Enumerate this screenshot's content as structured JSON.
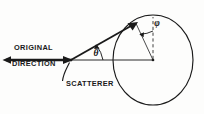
{
  "figure": {
    "background_color": "#fdfdfc",
    "ink_color": "#1a1a1a",
    "width": 204,
    "height": 114,
    "labels": {
      "original_line1": "ORIGINAL",
      "original_line2": "DIRECTION",
      "scatterer": "SCATTERER",
      "theta": "θ",
      "phi": "φ"
    },
    "elements": {
      "incident_beam": "horizontal double-ended arrow along original direction",
      "scattered_ray": "arrow from scatterer to point on sphere",
      "sphere": "ellipse representing sphere of observation",
      "radius_line": "line from sphere center to scattered ray endpoint",
      "polar_axis": "dashed vertical line from sphere center upward",
      "theta_arc": "curved arc marking scattering angle theta",
      "phi_arc": "curved arc marking azimuthal angle phi",
      "leader_line": "curved leader from scatterer point to SCATTERER label"
    },
    "geometry": {
      "beam_left_x": 4,
      "beam_y": 60,
      "scatterer_x": 70,
      "scatterer_y": 60,
      "sphere_center_x": 153,
      "sphere_center_y": 60,
      "sphere_rx": 40,
      "sphere_ry": 45,
      "ray_tip_x": 137,
      "ray_tip_y": 22
    }
  }
}
